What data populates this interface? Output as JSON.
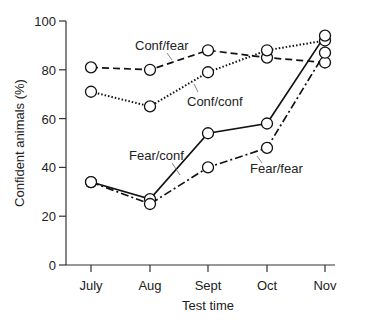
{
  "chart_data": {
    "type": "line",
    "title": "",
    "xlabel": "Test time",
    "ylabel": "Confident animals (%)",
    "ylim": [
      0,
      100
    ],
    "yticks": [
      0,
      20,
      40,
      60,
      80,
      100
    ],
    "categories": [
      "July",
      "Aug",
      "Sept",
      "Oct",
      "Nov"
    ],
    "series": [
      {
        "name": "Conf/fear",
        "style": "dashed",
        "values": [
          81,
          80,
          88,
          85,
          83
        ]
      },
      {
        "name": "Conf/conf",
        "style": "dotted",
        "values": [
          71,
          65,
          79,
          88,
          92
        ]
      },
      {
        "name": "Fear/conf",
        "style": "solid",
        "values": [
          34,
          27,
          54,
          58,
          94
        ]
      },
      {
        "name": "Fear/fear",
        "style": "dash-dot",
        "values": [
          34,
          25,
          40,
          48,
          87
        ]
      }
    ],
    "annotations": [
      "Conf/fear",
      "Conf/conf",
      "Fear/conf",
      "Fear/fear"
    ],
    "grid": false,
    "legend": "inline labels"
  }
}
